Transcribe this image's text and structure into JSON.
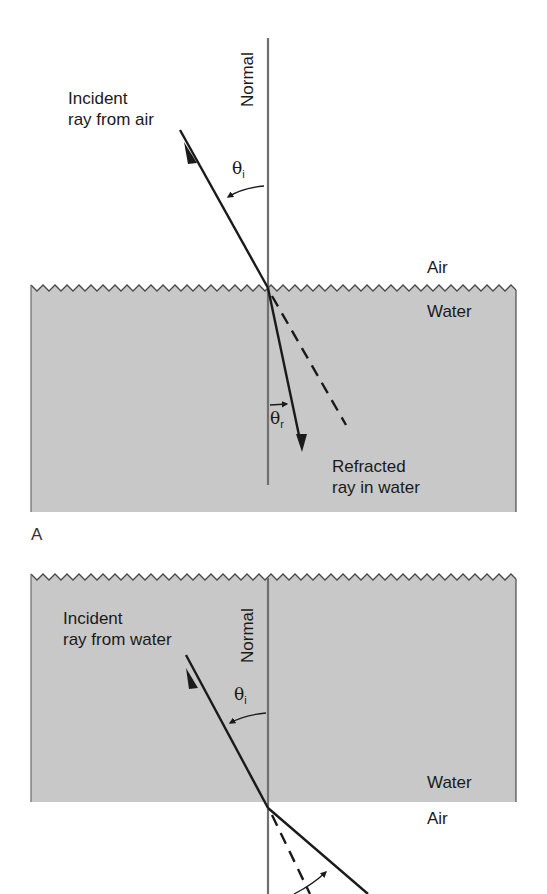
{
  "figure": {
    "panel_a": {
      "letter": "A",
      "normal_label": "Normal",
      "incident_label_line1": "Incident",
      "incident_label_line2": "ray from air",
      "theta_i_symbol": "θ",
      "theta_i_sub": "i",
      "theta_r_symbol": "θ",
      "theta_r_sub": "r",
      "upper_medium": "Air",
      "lower_medium": "Water",
      "refracted_label_line1": "Refracted",
      "refracted_label_line2": "ray in water"
    },
    "panel_b": {
      "normal_label": "Normal",
      "incident_label_line1": "Incident",
      "incident_label_line2": "ray from water",
      "theta_i_symbol": "θ",
      "theta_i_sub": "i",
      "upper_medium": "Water",
      "lower_medium": "Air"
    },
    "colors": {
      "water": "#c8c8c8",
      "line": "#1a1a1a",
      "normal": "#707070",
      "edge": "#4a4a4a"
    }
  }
}
